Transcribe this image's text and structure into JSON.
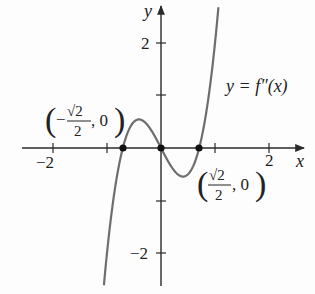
{
  "chart_data": {
    "type": "line",
    "title": "",
    "xlabel": "x",
    "ylabel": "y",
    "xlim": [
      -2.0,
      2.6
    ],
    "ylim": [
      -2.6,
      2.7
    ],
    "grid": false,
    "x_tick_labels": [
      "-2",
      "2"
    ],
    "y_tick_labels": [
      "2",
      "-2"
    ],
    "x_ticks": [
      -2,
      -1,
      1,
      2
    ],
    "y_ticks": [
      2,
      1,
      -1,
      -2
    ],
    "series": [
      {
        "name": "y = f''(x)",
        "function": "4x^3 - 2x",
        "x": [
          -1.08,
          -1.0,
          -0.9,
          -0.8,
          -0.7071,
          -0.6,
          -0.5,
          -0.4082,
          -0.3,
          -0.2,
          -0.1,
          0,
          0.1,
          0.2,
          0.3,
          0.4082,
          0.5,
          0.6,
          0.7071,
          0.8,
          0.9,
          1.0,
          1.05,
          1.1
        ],
        "values": [
          -2.88,
          -2.0,
          -1.12,
          -0.45,
          0.0,
          0.34,
          0.5,
          0.544,
          0.49,
          0.37,
          0.196,
          0,
          -0.196,
          -0.37,
          -0.49,
          -0.544,
          -0.5,
          -0.34,
          0.0,
          0.45,
          1.12,
          2.0,
          2.53,
          3.12
        ]
      }
    ],
    "points": [
      {
        "x": -0.7071,
        "y": 0,
        "label": "(-√2/2, 0)"
      },
      {
        "x": 0,
        "y": 0,
        "label": ""
      },
      {
        "x": 0.7071,
        "y": 0,
        "label": "(√2/2, 0)"
      }
    ],
    "annotations": [
      {
        "text": "y = f''(x)",
        "near": "upper right"
      }
    ]
  },
  "labels": {
    "y_axis": "y",
    "x_axis": "x",
    "ytick_2": "2",
    "ytick_neg2": "−2",
    "xtick_neg2": "−2",
    "xtick_2": "2",
    "curve": "y = f″(x)",
    "left_point_value": ", 0",
    "right_point_value": ", 0",
    "sqrt2": "√2",
    "den": "2",
    "minus": "−"
  },
  "colors": {
    "axis": "#2a2a2a",
    "curve": "#6e6e6e",
    "points": "#111111"
  }
}
